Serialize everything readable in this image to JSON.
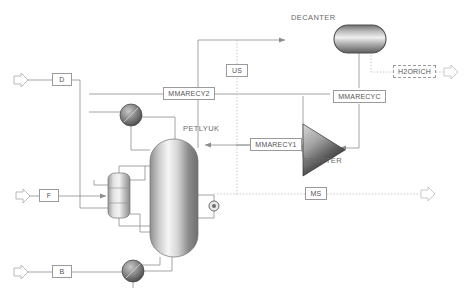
{
  "diagram": {
    "canvas": {
      "width": 472,
      "height": 302
    },
    "colors": {
      "line": "#8d8d8d",
      "dotted": "#b4b4b4",
      "label_border": "#9a9a9a",
      "label_text": "#555555",
      "block_text": "#6a6a6a",
      "vessel_dark": "#4a4a4a",
      "vessel_light": "#f2f2f2"
    }
  },
  "streams": [
    {
      "id": "D",
      "label": "D",
      "x": 52,
      "y": 73,
      "w": 20,
      "h": 14,
      "style": "solid"
    },
    {
      "id": "F",
      "label": "F",
      "x": 39,
      "y": 189,
      "w": 20,
      "h": 14,
      "style": "solid"
    },
    {
      "id": "B",
      "label": "B",
      "x": 52,
      "y": 265,
      "w": 20,
      "h": 14,
      "style": "solid"
    },
    {
      "id": "US",
      "label": "US",
      "x": 226,
      "y": 64,
      "w": 22,
      "h": 14,
      "style": "solid"
    },
    {
      "id": "MMARECY2",
      "label": "MMARECY2",
      "x": 163,
      "y": 87,
      "w": 52,
      "h": 14,
      "style": "solid"
    },
    {
      "id": "MMARECY1",
      "label": "MMARECY1",
      "x": 250,
      "y": 138,
      "w": 52,
      "h": 14,
      "style": "solid"
    },
    {
      "id": "MMARECYC",
      "label": "MMARECYC",
      "x": 333,
      "y": 90,
      "w": 53,
      "h": 14,
      "style": "solid"
    },
    {
      "id": "H2ORICH",
      "label": "H2ORICH",
      "x": 393,
      "y": 65,
      "w": 43,
      "h": 14,
      "style": "dashed"
    },
    {
      "id": "MS",
      "label": "MS",
      "x": 305,
      "y": 187,
      "w": 22,
      "h": 14,
      "style": "solid"
    }
  ],
  "blocks": [
    {
      "id": "DECANTER",
      "label": "DECANTER",
      "type": "horizontal-drum",
      "x": 291,
      "y": 13
    },
    {
      "id": "PETLYUK",
      "label": "PETLYUK",
      "type": "vertical-column",
      "x": 183,
      "y": 124
    },
    {
      "id": "SPLITTER",
      "label": "SPLITTER",
      "type": "triangle",
      "x": 303,
      "y": 156
    }
  ],
  "equipment": [
    {
      "id": "condenser",
      "name": "condenser-sphere",
      "cx": 131,
      "cy": 115,
      "r": 11
    },
    {
      "id": "reboiler",
      "name": "reboiler-sphere",
      "cx": 133,
      "cy": 271,
      "r": 11
    },
    {
      "id": "valve",
      "name": "valve-circle",
      "cx": 214,
      "cy": 206,
      "r": 5
    },
    {
      "id": "prefractionator",
      "name": "prefractionator-column",
      "x": 108,
      "y": 173,
      "w": 22,
      "h": 45
    },
    {
      "id": "main-column",
      "name": "petlyuk-main-column",
      "x": 150,
      "y": 139,
      "w": 48,
      "h": 118
    }
  ],
  "ports": [
    {
      "id": "feed-D-in",
      "name": "inlet-arrow-D",
      "x": 16,
      "y": 80,
      "dir": "right"
    },
    {
      "id": "feed-F-in",
      "name": "inlet-arrow-F",
      "x": 18,
      "y": 196,
      "dir": "right"
    },
    {
      "id": "feed-B-in",
      "name": "inlet-arrow-B",
      "x": 16,
      "y": 272,
      "dir": "right"
    },
    {
      "id": "h2orich-out",
      "name": "outlet-arrow-h2orich",
      "x": 448,
      "y": 72,
      "dir": "right"
    },
    {
      "id": "ms-out",
      "name": "outlet-arrow-ms",
      "x": 425,
      "y": 194,
      "dir": "right"
    }
  ]
}
